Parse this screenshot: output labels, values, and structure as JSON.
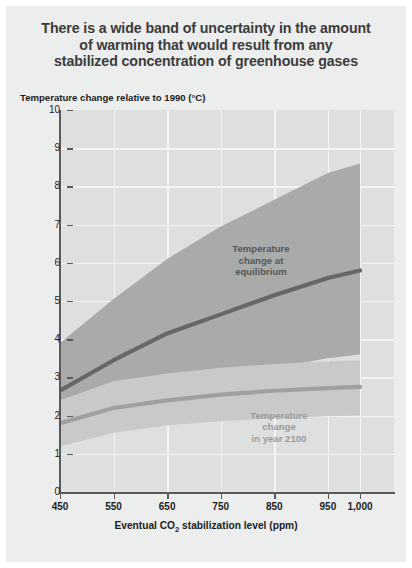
{
  "title": "There is a wide band of uncertainty in the amount of warming that would result from any stabilized concentration of greenhouse gases",
  "title_lines": [
    "There is a wide band of uncertainty in the amount",
    "of warming that would result from any",
    "stabilized concentration of greenhouse gases"
  ],
  "axis": {
    "y_label": "Temperature change relative to 1990 (°C)",
    "x_label_prefix": "Eventual CO",
    "x_label_sub": "2",
    "x_label_suffix": " stabilization level (ppm)",
    "y_ticks": [
      "10",
      "9",
      "8",
      "7",
      "6",
      "5",
      "4",
      "3",
      "2",
      "1",
      "0"
    ],
    "x_ticks": [
      "450",
      "550",
      "650",
      "750",
      "850",
      "950",
      "1,000"
    ]
  },
  "annotations": {
    "equilibrium_lines": [
      "Temperature",
      "change at",
      "equilibrium"
    ],
    "year2100_lines": [
      "Temperature",
      "change",
      "in year 2100"
    ]
  },
  "colors": {
    "page_background": "#eceded",
    "plot_background": "#dedfdf",
    "gridline": "#f3f4f4",
    "axis": "#5a5a5a",
    "band_equilibrium": "#a9abab",
    "band_2100": "#c8caca",
    "line_equilibrium": "#666868",
    "line_2100": "#9fa1a1",
    "title_text": "#3b3b3b",
    "label_text": "#1d1d1d"
  },
  "chart_data": {
    "type": "area",
    "title": "There is a wide band of uncertainty in the amount of warming that would result from any stabilized concentration of greenhouse gases",
    "xlabel": "Eventual CO2 stabilization level (ppm)",
    "ylabel": "Temperature change relative to 1990 (°C)",
    "xlim": [
      450,
      1000
    ],
    "ylim": [
      0,
      10
    ],
    "grid": true,
    "legend": "in-plot annotations",
    "x": [
      450,
      550,
      650,
      750,
      850,
      950,
      1000
    ],
    "series": [
      {
        "name": "Temperature change at equilibrium",
        "type": "line",
        "values": [
          2.65,
          3.45,
          4.15,
          4.65,
          5.15,
          5.6,
          5.8
        ]
      },
      {
        "name": "Temperature change at equilibrium (uncertainty band upper)",
        "type": "band-upper",
        "values": [
          3.9,
          5.05,
          6.1,
          6.95,
          7.65,
          8.35,
          8.6
        ]
      },
      {
        "name": "Temperature change at equilibrium (uncertainty band lower)",
        "type": "band-lower",
        "values": [
          1.75,
          2.3,
          2.7,
          3.0,
          3.25,
          3.5,
          3.6
        ]
      },
      {
        "name": "Temperature change in year 2100",
        "type": "line",
        "values": [
          1.8,
          2.2,
          2.4,
          2.55,
          2.65,
          2.72,
          2.75
        ]
      },
      {
        "name": "Temperature change in year 2100 (uncertainty band upper)",
        "type": "band-upper",
        "values": [
          2.4,
          2.9,
          3.1,
          3.25,
          3.35,
          3.42,
          3.45
        ]
      },
      {
        "name": "Temperature change in year 2100 (uncertainty band lower)",
        "type": "band-lower",
        "values": [
          1.2,
          1.55,
          1.75,
          1.85,
          1.93,
          1.98,
          2.0
        ]
      }
    ]
  }
}
